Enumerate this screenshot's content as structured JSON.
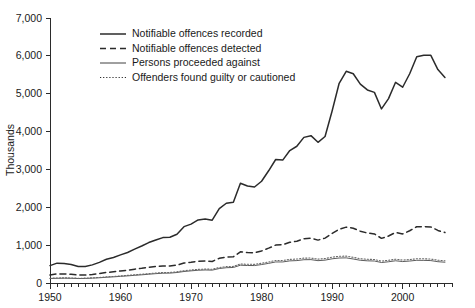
{
  "chart_data": {
    "type": "line",
    "title": "",
    "subtitle": "",
    "xlabel": "",
    "ylabel": "Thousands",
    "xlim": [
      1950,
      2007
    ],
    "ylim": [
      0,
      7000
    ],
    "grid": false,
    "legend_position": "top-left-inside",
    "y_ticks": [
      0,
      1000,
      2000,
      3000,
      4000,
      5000,
      6000,
      7000
    ],
    "y_tick_labels": [
      "0",
      "1,000",
      "2,000",
      "3,000",
      "4,000",
      "5,000",
      "6,000",
      "7,000"
    ],
    "x_ticks": [
      1950,
      1960,
      1970,
      1980,
      1990,
      2000
    ],
    "x_tick_labels": [
      "1950",
      "1960",
      "1970",
      "1980",
      "1990",
      "2000"
    ],
    "x_minor_tick_interval": 1,
    "x": [
      1950,
      1951,
      1952,
      1953,
      1954,
      1955,
      1956,
      1957,
      1958,
      1959,
      1960,
      1961,
      1962,
      1963,
      1964,
      1965,
      1966,
      1967,
      1968,
      1969,
      1970,
      1971,
      1972,
      1973,
      1974,
      1975,
      1976,
      1977,
      1978,
      1979,
      1980,
      1981,
      1982,
      1983,
      1984,
      1985,
      1986,
      1987,
      1988,
      1989,
      1990,
      1991,
      1992,
      1993,
      1994,
      1995,
      1996,
      1997,
      1998,
      1999,
      2000,
      2001,
      2002,
      2003,
      2004,
      2005,
      2006
    ],
    "series": [
      {
        "name": "Notifiable offences recorded",
        "style": "solid-thick",
        "color": "#2b2b2b",
        "values": [
          460,
          525,
          513,
          489,
          435,
          438,
          479,
          545,
          626,
          675,
          743,
          807,
          896,
          978,
          1068,
          1134,
          1199,
          1208,
          1289,
          1488,
          1556,
          1666,
          1690,
          1658,
          1963,
          2106,
          2136,
          2636,
          2561,
          2537,
          2688,
          2964,
          3262,
          3247,
          3499,
          3612,
          3847,
          3892,
          3716,
          3870,
          4544,
          5276,
          5592,
          5527,
          5253,
          5100,
          5036,
          4598,
          4871,
          5301,
          5171,
          5527,
          5975,
          6014,
          6014,
          5637,
          5428
        ],
        "peak": {
          "year": 2003,
          "value": 6014
        },
        "min": {
          "year": 1954,
          "value": 435
        }
      },
      {
        "name": "Notifiable offences detected",
        "style": "dashed",
        "color": "#2b2b2b",
        "values": [
          211,
          240,
          238,
          230,
          209,
          210,
          227,
          249,
          279,
          296,
          317,
          337,
          365,
          387,
          414,
          438,
          452,
          452,
          473,
          527,
          548,
          574,
          579,
          569,
          652,
          687,
          692,
          824,
          804,
          799,
          848,
          920,
          1002,
          1010,
          1076,
          1104,
          1167,
          1182,
          1133,
          1186,
          1307,
          1419,
          1476,
          1447,
          1368,
          1320,
          1297,
          1179,
          1241,
          1335,
          1297,
          1380,
          1486,
          1490,
          1482,
          1388,
          1333
        ]
      },
      {
        "name": "Persons proceeded against",
        "style": "solid-thin",
        "color": "#4a4a4a",
        "values": [
          118,
          124,
          127,
          125,
          118,
          120,
          128,
          138,
          152,
          162,
          176,
          188,
          203,
          216,
          232,
          247,
          258,
          261,
          277,
          304,
          321,
          337,
          344,
          340,
          382,
          404,
          410,
          470,
          462,
          461,
          487,
          519,
          556,
          556,
          584,
          592,
          615,
          617,
          590,
          604,
          639,
          660,
          664,
          634,
          600,
          586,
          581,
          541,
          561,
          587,
          566,
          580,
          600,
          598,
          592,
          563,
          549
        ]
      },
      {
        "name": "Offenders found guilty or cautioned",
        "style": "dotted",
        "color": "#6a6a6a",
        "values": [
          126,
          133,
          136,
          133,
          126,
          128,
          137,
          147,
          162,
          173,
          188,
          201,
          217,
          231,
          248,
          264,
          276,
          279,
          296,
          325,
          343,
          360,
          368,
          363,
          408,
          432,
          438,
          502,
          494,
          493,
          521,
          555,
          594,
          594,
          624,
          633,
          657,
          659,
          630,
          646,
          683,
          706,
          710,
          678,
          641,
          626,
          621,
          578,
          600,
          627,
          605,
          620,
          641,
          639,
          633,
          602,
          587
        ]
      }
    ],
    "legend": [
      {
        "label": "Notifiable offences recorded",
        "style": "solid-thick"
      },
      {
        "label": "Notifiable offences detected",
        "style": "dashed"
      },
      {
        "label": "Persons proceeded against",
        "style": "solid-thin"
      },
      {
        "label": "Offenders found guilty or cautioned",
        "style": "dotted"
      }
    ]
  }
}
